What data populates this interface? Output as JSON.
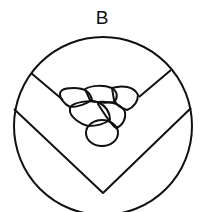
{
  "figure": {
    "label": "B",
    "stroke_color": "#111111",
    "background": "#ffffff",
    "weld_passes": 6
  }
}
